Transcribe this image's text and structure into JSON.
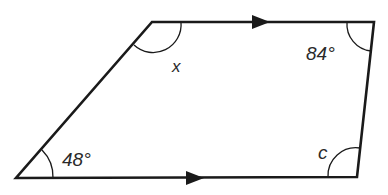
{
  "diagram": {
    "type": "trapezium",
    "stroke_color": "#1a1a1a",
    "angles": {
      "top_left": "x",
      "top_right": "84°",
      "bottom_left": "48°",
      "bottom_right": "c"
    },
    "parallel_markers": [
      "top-arrow",
      "bottom-arrow"
    ]
  }
}
